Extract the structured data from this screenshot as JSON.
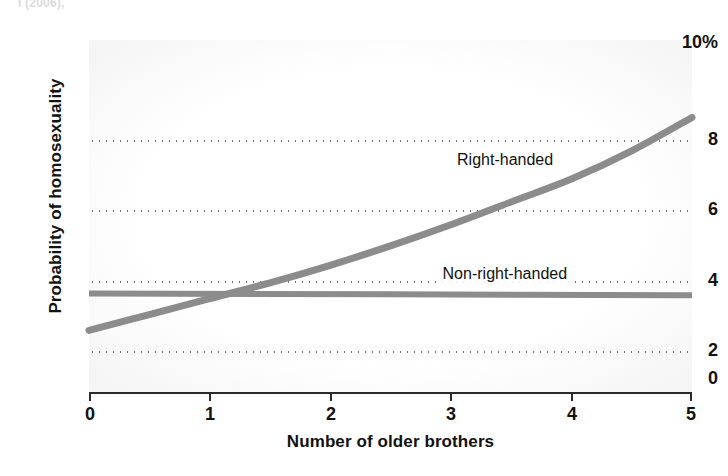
{
  "figure": {
    "clipped_caption": "l (2006),"
  },
  "chart_data": {
    "type": "line",
    "title": "",
    "xlabel": "Number of older brothers",
    "ylabel": "Probability of homosexuality",
    "xlim": [
      0,
      5
    ],
    "ylim": [
      0,
      10
    ],
    "x_ticks": [
      "0",
      "1",
      "2",
      "3",
      "4",
      "5"
    ],
    "x_tick_values": [
      0,
      1,
      2,
      3,
      4,
      5
    ],
    "y_ticks": [
      "0",
      "2",
      "4",
      "6",
      "8",
      "10%"
    ],
    "y_tick_values": [
      0,
      2,
      4,
      6,
      8,
      10
    ],
    "gridlines": {
      "horizontal_at": [
        2,
        4,
        6,
        8
      ],
      "style": "dotted",
      "vertical": false
    },
    "legend_position": "inline-labels",
    "units": "percent",
    "series": [
      {
        "name": "Right-handed",
        "color": "#8c8c8c",
        "x": [
          0,
          0.5,
          1,
          1.5,
          2,
          2.5,
          3,
          3.5,
          4,
          4.5,
          5
        ],
        "values": [
          1.75,
          2.2,
          2.65,
          3.1,
          3.6,
          4.15,
          4.75,
          5.4,
          6.05,
          6.85,
          7.8
        ]
      },
      {
        "name": "Non-right-handed",
        "color": "#8c8c8c",
        "x": [
          0,
          5
        ],
        "values": [
          2.8,
          2.75
        ]
      }
    ],
    "annotations": [
      {
        "text": "Right-handed",
        "x": 3.45,
        "y": 6.6
      },
      {
        "text": "Non-right-handed",
        "x": 3.45,
        "y": 3.35
      }
    ]
  },
  "colors": {
    "series_line": "#8c8c8c",
    "axis": "#2b2b2b",
    "grid_dot": "#6f6f6f",
    "text": "#121212",
    "plot_background": "#ffffff"
  }
}
